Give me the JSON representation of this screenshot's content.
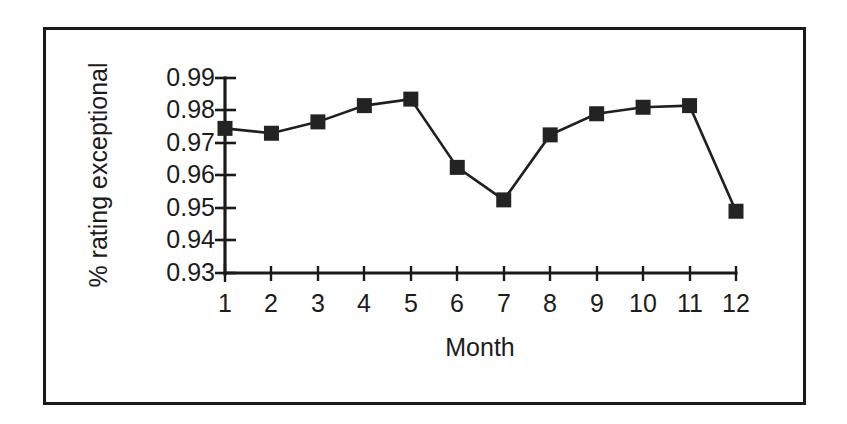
{
  "chart_data": {
    "type": "line",
    "title": "",
    "subtitle": "",
    "xlabel": "Month",
    "ylabel": "% rating exceptional",
    "x": [
      1,
      2,
      3,
      4,
      5,
      6,
      7,
      8,
      9,
      10,
      11,
      12
    ],
    "categories": [
      "1",
      "2",
      "3",
      "4",
      "5",
      "6",
      "7",
      "8",
      "9",
      "10",
      "11",
      "12"
    ],
    "values": [
      0.9745,
      0.973,
      0.9765,
      0.9815,
      0.9835,
      0.9625,
      0.9525,
      0.9725,
      0.979,
      0.981,
      0.9815,
      0.949
    ],
    "series": [
      {
        "name": "% rating exceptional",
        "values": [
          0.9745,
          0.973,
          0.9765,
          0.9815,
          0.9835,
          0.9625,
          0.9525,
          0.9725,
          0.979,
          0.981,
          0.9815,
          0.949
        ]
      }
    ],
    "ylim": [
      0.93,
      0.99
    ],
    "xlim": [
      1,
      12
    ],
    "ytick_labels": [
      "0.93",
      "0.94",
      "0.95",
      "0.96",
      "0.97",
      "0.98",
      "0.99"
    ],
    "ytick_values": [
      0.93,
      0.94,
      0.95,
      0.96,
      0.97,
      0.98,
      0.99
    ],
    "xtick_labels": [
      "1",
      "2",
      "3",
      "4",
      "5",
      "6",
      "7",
      "8",
      "9",
      "10",
      "11",
      "12"
    ],
    "grid": false,
    "legend": false,
    "legend_position": "none",
    "marker": "square",
    "line_color": "#1f1f1f",
    "marker_color": "#232323",
    "axis_color": "#1a1a1a",
    "background_color": "#ffffff",
    "frame_color": "#1a1a1a",
    "annotations": []
  },
  "labels": {
    "ylabel": "% rating exceptional",
    "xlabel": "Month",
    "y0": "0.93",
    "y1": "0.94",
    "y2": "0.95",
    "y3": "0.96",
    "y4": "0.97",
    "y5": "0.98",
    "y6": "0.99",
    "x1": "1",
    "x2": "2",
    "x3": "3",
    "x4": "4",
    "x5": "5",
    "x6": "6",
    "x7": "7",
    "x8": "8",
    "x9": "9",
    "x10": "10",
    "x11": "11",
    "x12": "12"
  }
}
